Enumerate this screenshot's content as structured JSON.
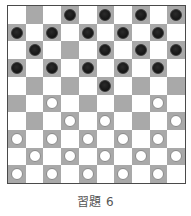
{
  "caption": "習題 6",
  "colors": {
    "light_square": "#ffffff",
    "dark_square": "#a9a9a9",
    "border": "#4a4a4a",
    "black_piece": "#1a1a1a",
    "white_piece": "#ffffff",
    "white_piece_outline": "#8a8a8a"
  },
  "board": {
    "size": 10,
    "dark_square_rule": "(row + col) is odd",
    "rows": [
      [
        ".",
        "_",
        ".",
        "b",
        ".",
        "b",
        ".",
        "b",
        ".",
        "b"
      ],
      [
        "b",
        ".",
        "b",
        ".",
        "b",
        ".",
        "b",
        ".",
        "b",
        "."
      ],
      [
        ".",
        "b",
        ".",
        "_",
        ".",
        "b",
        ".",
        "b",
        ".",
        "b"
      ],
      [
        "b",
        ".",
        "b",
        ".",
        "b",
        ".",
        "b",
        ".",
        "b",
        "."
      ],
      [
        ".",
        "_",
        ".",
        "_",
        ".",
        "b",
        ".",
        "_",
        ".",
        "_"
      ],
      [
        "_",
        ".",
        "w",
        ".",
        "_",
        ".",
        "_",
        ".",
        "w",
        "."
      ],
      [
        ".",
        "_",
        ".",
        "w",
        ".",
        "w",
        ".",
        "_",
        ".",
        "w"
      ],
      [
        "w",
        ".",
        "w",
        ".",
        "w",
        ".",
        "w",
        ".",
        "w",
        "."
      ],
      [
        ".",
        "w",
        ".",
        "w",
        ".",
        "w",
        ".",
        "w",
        ".",
        "w"
      ],
      [
        "w",
        ".",
        "w",
        ".",
        "w",
        ".",
        "w",
        ".",
        "w",
        "."
      ]
    ],
    "legend": {
      ".": "light square",
      "_": "empty dark square",
      "b": "black piece on dark square",
      "w": "white piece on dark square"
    },
    "piece_counts": {
      "black": 19,
      "white": 20
    }
  }
}
